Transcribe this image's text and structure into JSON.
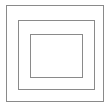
{
  "diagram": {
    "type": "nested-squares",
    "stroke_color": "#8a8a8a",
    "stroke_width": 1,
    "background": "#ffffff",
    "squares": [
      {
        "name": "outer-square",
        "x": 6,
        "y": 5,
        "width": 98,
        "height": 97
      },
      {
        "name": "middle-square",
        "x": 18,
        "y": 20,
        "width": 77,
        "height": 70
      },
      {
        "name": "inner-square",
        "x": 30,
        "y": 34,
        "width": 53,
        "height": 44
      }
    ]
  }
}
